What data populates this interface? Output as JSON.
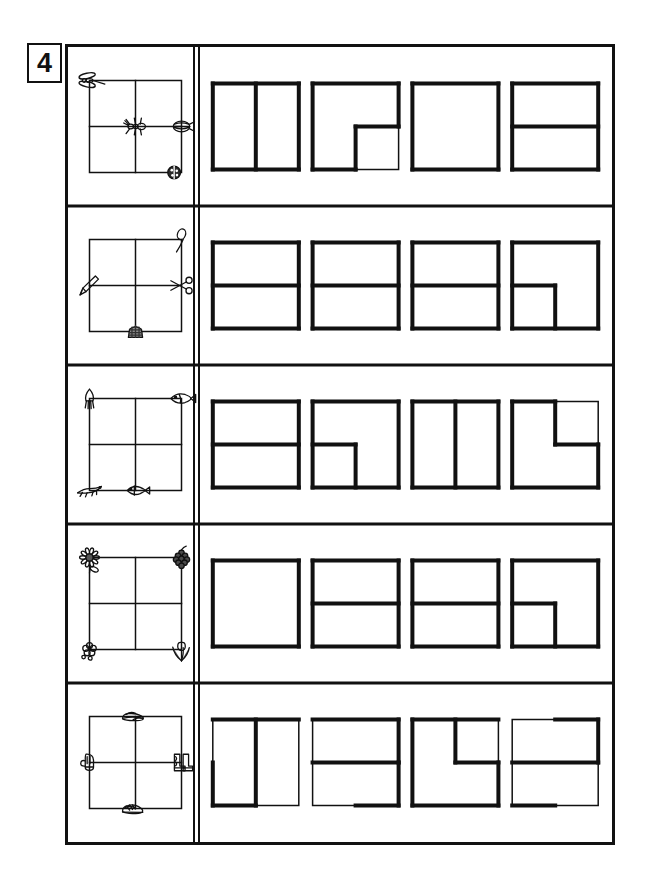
{
  "worksheet": {
    "exercise_number": "4",
    "title": "Shape partition matching worksheet",
    "instruction_note": "",
    "ink_color": "#111111",
    "paper_color": "#ffffff",
    "line_thin_px": 1.5,
    "line_bold_px": 4,
    "rows_count": 5,
    "answers_per_row": 4
  },
  "rows": [
    {
      "id": "row-1",
      "theme": "insects",
      "prompt": {
        "grid": "2x2",
        "grid_lines": {
          "vertical": true,
          "horizontal": true
        },
        "icons": [
          {
            "name": "dragonfly-icon",
            "position": "top-left-corner",
            "label": "dragonfly"
          },
          {
            "name": "ant-icon",
            "position": "center",
            "label": "ant"
          },
          {
            "name": "beetle-icon",
            "position": "middle-right",
            "label": "beetle"
          },
          {
            "name": "ladybug-icon",
            "position": "bottom-right",
            "label": "ladybug"
          }
        ]
      },
      "answers": [
        {
          "id": "r1a1",
          "shape": "vertical-split",
          "desc": "square with bold vertical centre line"
        },
        {
          "id": "r1a2",
          "shape": "l-shape-bottom-right-notch",
          "desc": "bold L outline, bottom-right quadrant cut out"
        },
        {
          "id": "r1a3",
          "shape": "plain-square",
          "desc": "bold plain square, no divider"
        },
        {
          "id": "r1a4",
          "shape": "horizontal-split",
          "desc": "square with bold horizontal centre line"
        }
      ]
    },
    {
      "id": "row-2",
      "theme": "tools-and-utensils",
      "prompt": {
        "grid": "2x2",
        "grid_lines": {
          "vertical": true,
          "horizontal": true
        },
        "icons": [
          {
            "name": "pencil-icon",
            "position": "middle-left",
            "label": "pencil"
          },
          {
            "name": "spoon-icon",
            "position": "top-right",
            "label": "spoon"
          },
          {
            "name": "scissors-icon",
            "position": "middle-right",
            "label": "scissors"
          },
          {
            "name": "thimble-icon",
            "position": "bottom-center",
            "label": "thimble"
          }
        ]
      },
      "answers": [
        {
          "id": "r2a1",
          "shape": "horizontal-split",
          "desc": "square with bold horizontal centre line"
        },
        {
          "id": "r2a2",
          "shape": "horizontal-split",
          "desc": "square with bold horizontal centre line"
        },
        {
          "id": "r2a3",
          "shape": "horizontal-split",
          "desc": "square with bold horizontal centre line"
        },
        {
          "id": "r2a4",
          "shape": "step-bottom-left",
          "desc": "bold step: horizontal half then down the centre"
        }
      ]
    },
    {
      "id": "row-3",
      "theme": "sea-creatures",
      "prompt": {
        "grid": "2x2",
        "grid_lines": {
          "vertical": true,
          "horizontal": true
        },
        "icons": [
          {
            "name": "squid-icon",
            "position": "top-left-corner",
            "label": "squid"
          },
          {
            "name": "flatfish-icon",
            "position": "top-right-corner",
            "label": "flatfish"
          },
          {
            "name": "lizard-icon",
            "position": "bottom-left-corner",
            "label": "lizard"
          },
          {
            "name": "fish-icon",
            "position": "bottom-center",
            "label": "fish"
          }
        ]
      },
      "answers": [
        {
          "id": "r3a1",
          "shape": "horizontal-split",
          "desc": "square with bold horizontal centre line"
        },
        {
          "id": "r3a2",
          "shape": "step-bottom-right-notch",
          "desc": "bold step into the lower-right quadrant"
        },
        {
          "id": "r3a3",
          "shape": "vertical-split",
          "desc": "square with bold vertical centre line"
        },
        {
          "id": "r3a4",
          "shape": "l-shape-top-right-notch",
          "desc": "bold L outline, top-right quadrant cut out"
        }
      ]
    },
    {
      "id": "row-4",
      "theme": "plants-and-flowers",
      "prompt": {
        "grid": "2x2",
        "grid_lines": {
          "vertical": true,
          "horizontal": true
        },
        "icons": [
          {
            "name": "sunflower-icon",
            "position": "top-left-corner",
            "label": "sunflower"
          },
          {
            "name": "grapes-icon",
            "position": "top-right-corner",
            "label": "grapes"
          },
          {
            "name": "blossom-icon",
            "position": "bottom-left-corner",
            "label": "blossom"
          },
          {
            "name": "tulip-icon",
            "position": "bottom-right-corner",
            "label": "tulip"
          }
        ]
      },
      "answers": [
        {
          "id": "r4a1",
          "shape": "plain-square",
          "desc": "bold plain square, no divider"
        },
        {
          "id": "r4a2",
          "shape": "horizontal-split",
          "desc": "square with bold horizontal centre line"
        },
        {
          "id": "r4a3",
          "shape": "horizontal-split",
          "desc": "square with bold horizontal centre line"
        },
        {
          "id": "r4a4",
          "shape": "step-bottom-right-notch",
          "desc": "bold step into the lower-right quadrant"
        }
      ]
    },
    {
      "id": "row-5",
      "theme": "footwear-and-gloves",
      "prompt": {
        "grid": "2x2",
        "grid_lines": {
          "vertical": true,
          "horizontal": true
        },
        "icons": [
          {
            "name": "slippers-icon",
            "position": "top-center",
            "label": "slippers"
          },
          {
            "name": "mittens-icon",
            "position": "middle-left",
            "label": "mittens"
          },
          {
            "name": "boots-icon",
            "position": "middle-right",
            "label": "boots"
          },
          {
            "name": "sneakers-icon",
            "position": "bottom-center",
            "label": "sneakers"
          }
        ]
      },
      "answers": [
        {
          "id": "r5a1",
          "shape": "vertical-split-partial",
          "desc": "vertical centre line bold, partial bold left and bottom edges"
        },
        {
          "id": "r5a2",
          "shape": "horizontal-split-partial",
          "desc": "horizontal centre line bold, partial bold right and bottom edges"
        },
        {
          "id": "r5a3",
          "shape": "z-step",
          "desc": "bold Z path through the square"
        },
        {
          "id": "r5a4",
          "shape": "horizontal-split-partial-2",
          "desc": "horizontal centre line bold, partial bold top and bottom edges"
        }
      ]
    }
  ]
}
